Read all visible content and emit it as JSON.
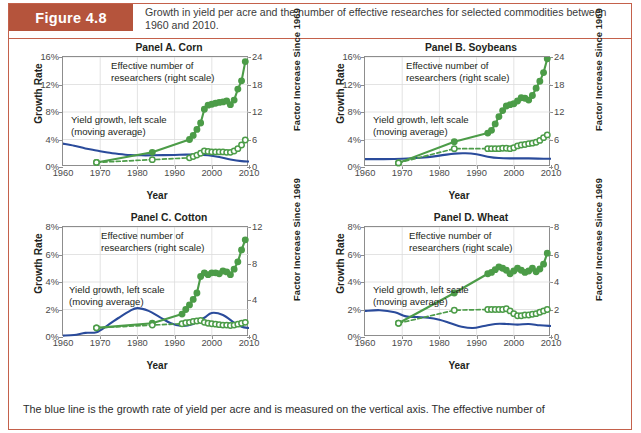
{
  "figure": {
    "tag": "Figure 4.8",
    "caption": "Growth in yield per acre and the number of effective researches for selected commodities between 1960 and 2010.",
    "footnote": "The blue line is the growth rate of yield per acre and is measured on the vertical axis. The effective number of",
    "accent_color": "#b5543c",
    "border_color": "#c4614b",
    "blue_color": "#2a4b9b",
    "green_color": "#4c9c48"
  },
  "common": {
    "ylabel_left": "Growth Rate",
    "ylabel_right": "Factor Increase Since 1969",
    "xlabel": "Year",
    "annotation_green": "Effective number of\nresearchers (right scale)",
    "annotation_blue": "Yield growth, left scale\n(moving average)",
    "xticks": [
      "1960",
      "1970",
      "1980",
      "1990",
      "2000",
      "2010"
    ]
  },
  "chart_data": [
    {
      "type": "line",
      "title": "Panel A. Corn",
      "xlabel": "Year",
      "ylabel": "Growth Rate",
      "ylabel_right": "Factor Increase Since 1969",
      "xlim": [
        1960,
        2010
      ],
      "xticks": [
        1960,
        1970,
        1980,
        1990,
        2000,
        2010
      ],
      "ylim_left": [
        0,
        16
      ],
      "yticks_left": [
        "0%",
        "4%",
        "8%",
        "12%",
        "16%"
      ],
      "ylim_right": [
        0,
        24
      ],
      "yticks_right": [
        "0",
        "6",
        "12",
        "18",
        "24"
      ],
      "grid": true,
      "legend_position": "inline-annotation",
      "series": [
        {
          "name": "Yield growth, left scale (moving average)",
          "axis": "left",
          "color": "#2a4b9b",
          "style": "solid",
          "x": [
            1960,
            1963,
            1966,
            1969,
            1972,
            1975,
            1978,
            1981,
            1984,
            1987,
            1990,
            1993,
            1996,
            1999,
            2002,
            2005,
            2008,
            2010
          ],
          "values": [
            3.4,
            3.1,
            2.7,
            2.4,
            2.1,
            1.9,
            1.75,
            1.7,
            1.7,
            1.72,
            1.75,
            1.8,
            1.8,
            1.7,
            1.45,
            1.1,
            0.85,
            0.8
          ]
        },
        {
          "name": "Effective number of researchers (right scale) — solid markers",
          "axis": "right",
          "color": "#4c9c48",
          "style": "solid-filled-markers",
          "x": [
            1969,
            1984,
            1994,
            1995,
            1996,
            1997,
            1998,
            1999,
            2000,
            2001,
            2002,
            2003,
            2004,
            2005,
            2006,
            2007,
            2008,
            2009
          ],
          "values": [
            1.0,
            3.2,
            6.0,
            6.9,
            8.2,
            9.6,
            12.6,
            13.5,
            13.7,
            13.9,
            14.1,
            14.2,
            14.4,
            13.6,
            14.6,
            17.0,
            18.8,
            23.0
          ]
        },
        {
          "name": "Effective number of researchers (right scale) — open markers / dashed",
          "axis": "right",
          "color": "#4c9c48",
          "style": "dashed-open-markers",
          "x": [
            1969,
            1984,
            1994,
            1995,
            1996,
            1997,
            1998,
            1999,
            2000,
            2001,
            2002,
            2003,
            2004,
            2005,
            2006,
            2007,
            2008,
            2009
          ],
          "values": [
            1.0,
            1.6,
            2.0,
            2.3,
            2.6,
            3.0,
            3.5,
            3.4,
            3.3,
            3.3,
            3.3,
            3.3,
            3.2,
            3.2,
            3.5,
            4.0,
            4.8,
            5.9
          ]
        }
      ]
    },
    {
      "type": "line",
      "title": "Panel B. Soybeans",
      "xlabel": "Year",
      "ylabel": "Growth Rate",
      "ylabel_right": "Factor Increase Since 1969",
      "xlim": [
        1960,
        2010
      ],
      "xticks": [
        1960,
        1970,
        1980,
        1990,
        2000,
        2010
      ],
      "ylim_left": [
        0,
        16
      ],
      "yticks_left": [
        "0%",
        "4%",
        "8%",
        "12%",
        "16%"
      ],
      "ylim_right": [
        0,
        24
      ],
      "yticks_right": [
        "0",
        "6",
        "12",
        "18",
        "24"
      ],
      "grid": true,
      "legend_position": "inline-annotation",
      "series": [
        {
          "name": "Yield growth, left scale (moving average)",
          "axis": "left",
          "color": "#2a4b9b",
          "style": "solid",
          "x": [
            1960,
            1965,
            1970,
            1975,
            1980,
            1984,
            1987,
            1990,
            1993,
            1996,
            2000,
            2004,
            2008,
            2010
          ],
          "values": [
            1.15,
            1.15,
            1.2,
            1.35,
            1.65,
            1.95,
            2.0,
            1.85,
            1.5,
            1.3,
            1.25,
            1.25,
            1.2,
            1.2
          ]
        },
        {
          "name": "Effective number of researchers (right scale) — solid markers",
          "axis": "right",
          "color": "#4c9c48",
          "style": "solid-filled-markers",
          "x": [
            1969,
            1984,
            1993,
            1994,
            1995,
            1996,
            1997,
            1998,
            1999,
            2000,
            2001,
            2002,
            2003,
            2004,
            2005,
            2006,
            2007,
            2008,
            2009
          ],
          "values": [
            0.9,
            5.5,
            7.4,
            8.0,
            9.4,
            11.0,
            12.3,
            13.3,
            13.6,
            13.8,
            14.4,
            15.1,
            15.0,
            14.6,
            15.6,
            17.2,
            18.7,
            20.6,
            23.6
          ]
        },
        {
          "name": "Effective number of researchers (right scale) — open markers / dashed",
          "axis": "right",
          "color": "#4c9c48",
          "style": "dashed-open-markers",
          "x": [
            1969,
            1984,
            1993,
            1994,
            1995,
            1996,
            1997,
            1998,
            1999,
            2000,
            2001,
            2002,
            2003,
            2004,
            2005,
            2006,
            2007,
            2008,
            2009
          ],
          "values": [
            0.9,
            4.0,
            4.0,
            4.0,
            4.0,
            4.0,
            4.1,
            4.1,
            4.0,
            4.2,
            4.6,
            4.8,
            4.9,
            5.1,
            5.2,
            5.4,
            5.8,
            6.4,
            7.0
          ]
        }
      ]
    },
    {
      "type": "line",
      "title": "Panel C. Cotton",
      "xlabel": "Year",
      "ylabel": "Growth Rate",
      "ylabel_right": "Factor Increase Since 1969",
      "xlim": [
        1960,
        2010
      ],
      "xticks": [
        1960,
        1970,
        1980,
        1990,
        2000,
        2010
      ],
      "ylim_left": [
        0,
        8
      ],
      "yticks_left": [
        "0%",
        "2%",
        "4%",
        "6%",
        "8%"
      ],
      "ylim_right": [
        0,
        12
      ],
      "yticks_right": [
        "0",
        "4",
        "8",
        "12"
      ],
      "grid": true,
      "legend_position": "inline-annotation",
      "series": [
        {
          "name": "Yield growth, left scale (moving average)",
          "axis": "left",
          "color": "#2a4b9b",
          "style": "solid",
          "x": [
            1960,
            1963,
            1966,
            1969,
            1972,
            1975,
            1978,
            1980,
            1983,
            1986,
            1989,
            1992,
            1995,
            1998,
            2000,
            2003,
            2006,
            2008,
            2010
          ],
          "values": [
            0.1,
            0.15,
            0.3,
            0.35,
            0.85,
            1.4,
            1.9,
            2.1,
            1.9,
            1.45,
            1.0,
            0.8,
            0.95,
            1.4,
            1.75,
            1.6,
            1.05,
            0.75,
            0.65
          ]
        },
        {
          "name": "Effective number of researchers (right scale) — solid markers",
          "axis": "right",
          "color": "#4c9c48",
          "style": "solid-filled-markers",
          "x": [
            1969,
            1984,
            1992,
            1993,
            1994,
            1995,
            1996,
            1997,
            1998,
            1999,
            2000,
            2001,
            2002,
            2003,
            2004,
            2005,
            2006,
            2007,
            2008,
            2009
          ],
          "values": [
            1.0,
            1.5,
            2.5,
            3.0,
            3.5,
            4.1,
            4.8,
            6.6,
            7.0,
            6.8,
            7.0,
            7.0,
            6.9,
            7.2,
            7.1,
            6.8,
            7.4,
            8.2,
            9.5,
            10.6
          ]
        },
        {
          "name": "Effective number of researchers (right scale) — open markers / dashed",
          "axis": "right",
          "color": "#4c9c48",
          "style": "dashed-open-markers",
          "x": [
            1969,
            1984,
            1992,
            1993,
            1994,
            1995,
            1996,
            1997,
            1998,
            1999,
            2000,
            2001,
            2002,
            2003,
            2004,
            2005,
            2006,
            2007,
            2008,
            2009
          ],
          "values": [
            1.0,
            1.3,
            1.45,
            1.55,
            1.6,
            1.7,
            1.75,
            1.8,
            1.6,
            1.5,
            1.45,
            1.4,
            1.35,
            1.3,
            1.3,
            1.25,
            1.3,
            1.4,
            1.5,
            1.6
          ]
        }
      ]
    },
    {
      "type": "line",
      "title": "Panel D. Wheat",
      "xlabel": "Year",
      "ylabel": "Growth Rate",
      "ylabel_right": "Factor Increase Since 1969",
      "xlim": [
        1960,
        2010
      ],
      "xticks": [
        1960,
        1970,
        1980,
        1990,
        2000,
        2010
      ],
      "ylim_left": [
        0,
        8
      ],
      "yticks_left": [
        "0%",
        "2%",
        "4%",
        "6%",
        "8%"
      ],
      "ylim_right": [
        0,
        8
      ],
      "yticks_right": [
        "0",
        "2",
        "4",
        "6",
        "8"
      ],
      "grid": true,
      "legend_position": "inline-annotation",
      "series": [
        {
          "name": "Yield growth, left scale (moving average)",
          "axis": "left",
          "color": "#2a4b9b",
          "style": "solid",
          "x": [
            1960,
            1964,
            1968,
            1971,
            1974,
            1977,
            1980,
            1983,
            1986,
            1989,
            1992,
            1995,
            1998,
            2001,
            2004,
            2007,
            2010
          ],
          "values": [
            1.9,
            1.95,
            1.8,
            1.5,
            1.45,
            1.4,
            1.25,
            1.0,
            0.75,
            0.65,
            0.8,
            0.95,
            0.95,
            0.9,
            0.95,
            0.85,
            0.8
          ]
        },
        {
          "name": "Effective number of researchers (right scale) — solid markers",
          "axis": "right",
          "color": "#4c9c48",
          "style": "solid-filled-markers",
          "x": [
            1969,
            1984,
            1993,
            1994,
            1995,
            1996,
            1997,
            1998,
            1999,
            2000,
            2001,
            2002,
            2003,
            2004,
            2005,
            2006,
            2007,
            2008,
            2009
          ],
          "values": [
            1.0,
            3.2,
            4.6,
            4.7,
            4.9,
            5.1,
            5.0,
            4.85,
            4.6,
            4.8,
            5.0,
            4.85,
            4.7,
            4.8,
            5.0,
            4.75,
            4.95,
            5.3,
            6.1
          ]
        },
        {
          "name": "Effective number of researchers (right scale) — open markers / dashed",
          "axis": "right",
          "color": "#4c9c48",
          "style": "dashed-open-markers",
          "x": [
            1969,
            1984,
            1993,
            1994,
            1995,
            1996,
            1997,
            1998,
            1999,
            2000,
            2001,
            2002,
            2003,
            2004,
            2005,
            2006,
            2007,
            2008,
            2009
          ],
          "values": [
            1.0,
            1.95,
            2.0,
            2.0,
            2.0,
            2.0,
            2.0,
            2.05,
            1.9,
            1.7,
            1.55,
            1.55,
            1.6,
            1.6,
            1.65,
            1.7,
            1.8,
            1.9,
            2.0
          ]
        }
      ]
    }
  ]
}
